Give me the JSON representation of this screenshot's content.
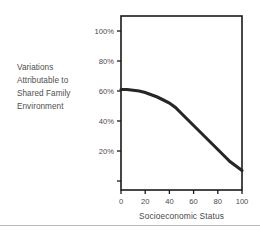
{
  "chart_data": {
    "type": "line",
    "title": "",
    "xlabel": "Socioeconomic Status",
    "ylabel": "Variations Attributable to Shared Family Environment",
    "ylabel_lines": [
      "Variations",
      "Attributable to",
      "Shared Family",
      "Environment"
    ],
    "xlim": [
      0,
      100
    ],
    "ylim": [
      -6,
      110
    ],
    "xticks": [
      0,
      20,
      40,
      60,
      80,
      100
    ],
    "xticklabels": [
      "0",
      "20",
      "40",
      "60",
      "80",
      "100"
    ],
    "yticks": [
      20,
      40,
      60,
      80,
      100
    ],
    "yticklabels": [
      "20%",
      "40%",
      "60%",
      "80%",
      "100%"
    ],
    "grid": false,
    "legend": false,
    "series": [
      {
        "name": "Shared family environment variance",
        "color": "#262626",
        "x": [
          0,
          5,
          10,
          15,
          20,
          25,
          30,
          35,
          40,
          45,
          50,
          55,
          60,
          65,
          70,
          75,
          80,
          85,
          90,
          95,
          100
        ],
        "values": [
          61,
          61,
          60.5,
          60,
          59,
          57.5,
          56,
          54,
          52,
          49,
          45,
          41,
          37,
          33,
          29,
          25,
          21,
          17,
          13,
          10,
          7
        ]
      }
    ]
  },
  "figure": {
    "xaxis_title": "Socioeconomic Status"
  }
}
